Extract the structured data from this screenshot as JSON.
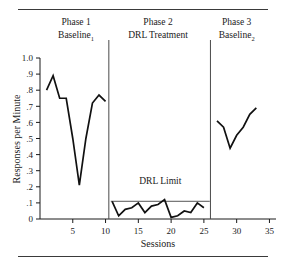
{
  "figure": {
    "rules": {
      "top": "",
      "bottom": ""
    }
  },
  "chart_data": {
    "type": "line",
    "title": "",
    "xlabel": "Sessions",
    "ylabel": "Responses per Minute",
    "xlim": [
      0,
      36
    ],
    "ylim": [
      0,
      1.0
    ],
    "grid": false,
    "legend": "none",
    "xticks": [
      5,
      10,
      15,
      20,
      25,
      30,
      35
    ],
    "xtick_labels": [
      "5",
      "10",
      "15",
      "20",
      "25",
      "30",
      "35"
    ],
    "yticks": [
      0,
      0.1,
      0.2,
      0.3,
      0.4,
      0.5,
      0.6,
      0.7,
      0.8,
      0.9,
      1.0
    ],
    "ytick_labels": [
      "0",
      ".1",
      ".2",
      ".3",
      ".4",
      ".5",
      ".6",
      ".7",
      ".8",
      ".9",
      "1.0"
    ],
    "phases": [
      {
        "id": "phase-1",
        "title": "Phase 1",
        "condition": "Baseline",
        "condition_subscript": "1",
        "x_start": 1,
        "x_end": 10,
        "x": [
          1,
          2,
          3,
          4,
          5,
          6,
          7,
          8,
          9,
          10
        ],
        "values": [
          0.8,
          0.89,
          0.75,
          0.75,
          0.5,
          0.21,
          0.5,
          0.72,
          0.77,
          0.73
        ]
      },
      {
        "id": "phase-2",
        "title": "Phase 2",
        "condition": "DRL Treatment",
        "condition_subscript": "",
        "x_start": 11,
        "x_end": 25,
        "x": [
          11,
          12,
          13,
          14,
          15,
          16,
          17,
          18,
          19,
          20,
          21,
          22,
          23,
          24,
          25
        ],
        "values": [
          0.11,
          0.02,
          0.06,
          0.07,
          0.1,
          0.04,
          0.08,
          0.09,
          0.12,
          0.01,
          0.02,
          0.05,
          0.04,
          0.1,
          0.07
        ]
      },
      {
        "id": "phase-3",
        "title": "Phase 3",
        "condition": "Baseline",
        "condition_subscript": "2",
        "x_start": 27,
        "x_end": 33,
        "x": [
          27,
          28,
          29,
          30,
          31,
          32,
          33
        ],
        "values": [
          0.61,
          0.57,
          0.44,
          0.52,
          0.57,
          0.65,
          0.69
        ]
      }
    ],
    "phase_dividers": [
      10.5,
      26.0
    ],
    "annotations": [
      {
        "id": "drl-limit",
        "label": "DRL Limit",
        "type": "hline",
        "y": 0.11,
        "x_start": 10.8,
        "x_end": 25.9,
        "label_y": 0.22
      }
    ]
  }
}
